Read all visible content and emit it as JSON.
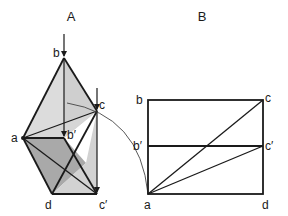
{
  "figure_a": {
    "title": "A",
    "labels": {
      "b": "b",
      "c": "c",
      "a": "a",
      "b_prime": "b′",
      "d": "d",
      "c_prime": "c′"
    },
    "colors": {
      "light_face": "#d9d9d9",
      "dark_face": "#a8a8a8",
      "mid_face": "#c4c4c4",
      "stroke": "#1a1a1a"
    }
  },
  "figure_b": {
    "title": "B",
    "labels": {
      "b": "b",
      "c": "c",
      "b_prime": "b′",
      "c_prime": "c′",
      "a": "a",
      "d": "d"
    }
  }
}
